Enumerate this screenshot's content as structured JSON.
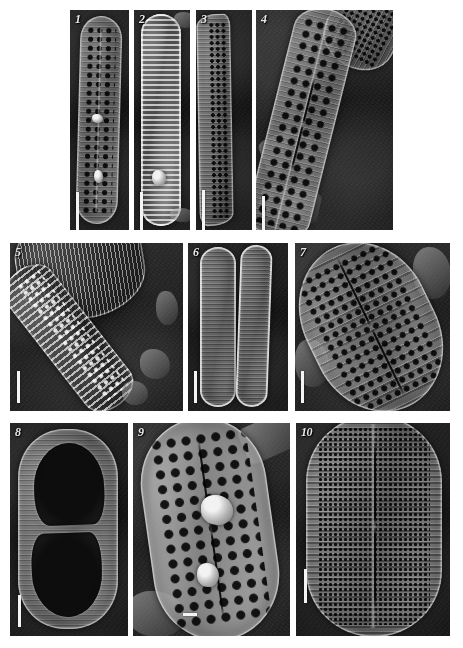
{
  "figure": {
    "kind": "sem-micrograph-plate",
    "width": 463,
    "height": 648,
    "background_color": "#ffffff",
    "rows": 3,
    "panel_count": 10,
    "label_color": "#e8e8e8",
    "scalebar_color": "#f4f4f4"
  },
  "panels": [
    {
      "number": "1",
      "label": "1",
      "view": "valve-face",
      "orientation": "vertical",
      "subject": "elongate lanceolate diatom valve with rows of areolae",
      "x": 70,
      "y": 10,
      "w": 59,
      "h": 220,
      "scalebar": {
        "x": 6,
        "y": 182,
        "w": 3,
        "h": 40
      }
    },
    {
      "number": "2",
      "label": "2",
      "view": "girdle-band",
      "orientation": "vertical",
      "subject": "elongate valve in girdle view with bright transverse bands",
      "x": 134,
      "y": 10,
      "w": 56,
      "h": 220,
      "scalebar": {
        "x": 6,
        "y": 182,
        "w": 3,
        "h": 40
      }
    },
    {
      "number": "3",
      "label": "3",
      "view": "girdle-side",
      "orientation": "vertical",
      "subject": "sigmoid valve margin in oblique side view",
      "x": 196,
      "y": 10,
      "w": 56,
      "h": 220,
      "scalebar": {
        "x": 6,
        "y": 180,
        "w": 3,
        "h": 42
      }
    },
    {
      "number": "4",
      "label": "4",
      "view": "valve-face",
      "orientation": "oblique",
      "subject": "tilted lanceolate valve with coarse areolae and adjacent frustule",
      "x": 256,
      "y": 10,
      "w": 137,
      "h": 220,
      "scalebar": {
        "x": 6,
        "y": 186,
        "w": 3,
        "h": 36
      }
    },
    {
      "number": "5",
      "label": "5",
      "view": "internal-valve",
      "orientation": "oblique",
      "subject": "broken valve showing internal costae and alveoli over debris field",
      "x": 10,
      "y": 243,
      "w": 173,
      "h": 168,
      "scalebar": {
        "x": 7,
        "y": 128,
        "w": 3,
        "h": 32
      }
    },
    {
      "number": "6",
      "label": "6",
      "view": "girdle-pair",
      "orientation": "vertical",
      "subject": "two linear valves lying side by side in girdle view",
      "x": 188,
      "y": 243,
      "w": 100,
      "h": 168,
      "scalebar": {
        "x": 6,
        "y": 128,
        "w": 3,
        "h": 32
      }
    },
    {
      "number": "7",
      "label": "7",
      "view": "valve-face",
      "orientation": "oblique",
      "subject": "broadly elliptical valve with biseriate striae and central raphe",
      "x": 295,
      "y": 243,
      "w": 155,
      "h": 168,
      "scalebar": {
        "x": 6,
        "y": 128,
        "w": 3,
        "h": 32
      }
    },
    {
      "number": "8",
      "label": "8",
      "view": "internal-valve",
      "orientation": "vertical",
      "subject": "elliptical valve interior with two large opposed lobate openings",
      "x": 10,
      "y": 423,
      "w": 118,
      "h": 213,
      "scalebar": {
        "x": 8,
        "y": 172,
        "w": 3,
        "h": 32
      }
    },
    {
      "number": "9",
      "label": "9",
      "view": "valve-face",
      "orientation": "oblique",
      "subject": "broad elliptical valve with coarse scattered areolae and debris lumps",
      "x": 133,
      "y": 423,
      "w": 157,
      "h": 213,
      "scalebar": {
        "x": 50,
        "y": 190,
        "w": 3,
        "h": 14
      }
    },
    {
      "number": "10",
      "label": "10",
      "view": "valve-face",
      "orientation": "vertical",
      "subject": "elliptical valve with dense transverse striae and narrow axial area",
      "x": 296,
      "y": 423,
      "w": 154,
      "h": 213,
      "scalebar": {
        "x": 8,
        "y": 146,
        "w": 3,
        "h": 34
      }
    }
  ]
}
